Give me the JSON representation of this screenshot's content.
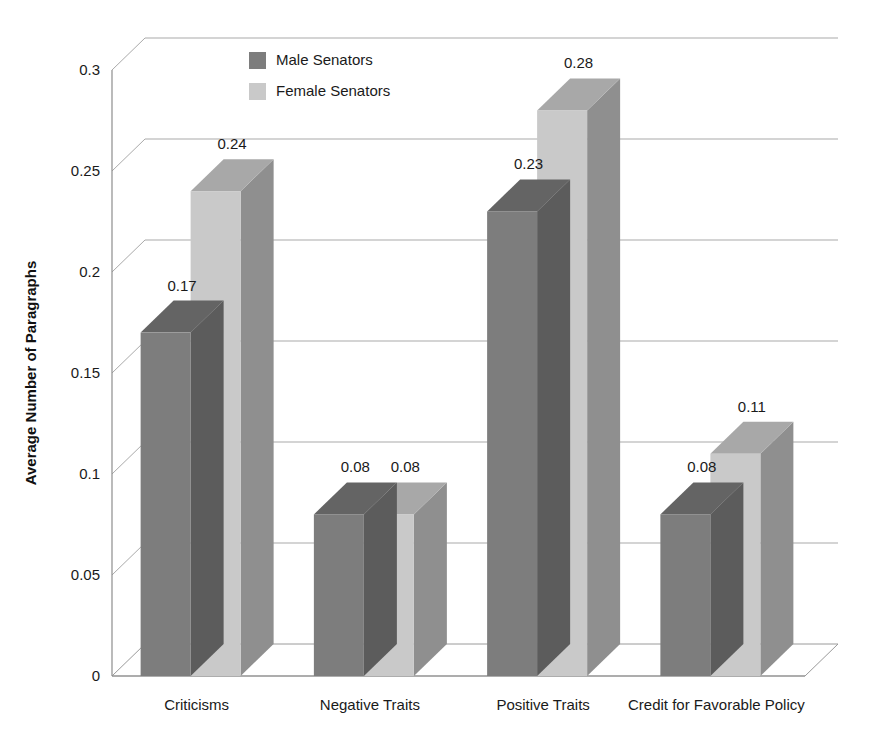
{
  "chart_data": {
    "type": "bar",
    "title": "",
    "subtitle": "",
    "xlabel": "",
    "ylabel": "Average Number of Paragraphs",
    "categories": [
      "Criticisms",
      "Negative Traits",
      "Positive Traits",
      "Credit for Favorable Policy"
    ],
    "series": [
      {
        "name": "Male Senators",
        "values": [
          0.17,
          0.08,
          0.23,
          0.08
        ],
        "color": "#7d7d7d"
      },
      {
        "name": "Female Senators",
        "values": [
          0.24,
          0.08,
          0.28,
          0.11
        ],
        "color": "#c9c9c9"
      }
    ],
    "value_labels": [
      [
        "0.17",
        "0.08",
        "0.23",
        "0.08"
      ],
      [
        "0.24",
        "0.08",
        "0.28",
        "0.11"
      ]
    ],
    "ylim": [
      0,
      0.3
    ],
    "ytick_values": [
      0,
      0.05,
      0.1,
      0.15,
      0.2,
      0.25,
      0.3
    ],
    "ytick_labels": [
      "0",
      "0.05",
      "0.1",
      "0.15",
      "0.2",
      "0.25",
      "0.3"
    ],
    "grid": true,
    "legend_position": "top-center",
    "style": "3d-clustered-column",
    "background": "#ffffff"
  },
  "legend": {
    "items": [
      {
        "label": "Male Senators",
        "swatch": "#7d7d7d"
      },
      {
        "label": "Female Senators",
        "swatch": "#c9c9c9"
      }
    ]
  },
  "colors": {
    "male_front": "#7d7d7d",
    "male_top": "#646464",
    "male_side": "#5c5c5c",
    "female_front": "#c9c9c9",
    "female_top": "#a8a8a8",
    "female_side": "#8f8f8f",
    "gridline": "#9a9a9a",
    "axis": "#8d8d8d",
    "text": "#1a1a1a",
    "background": "#ffffff"
  }
}
